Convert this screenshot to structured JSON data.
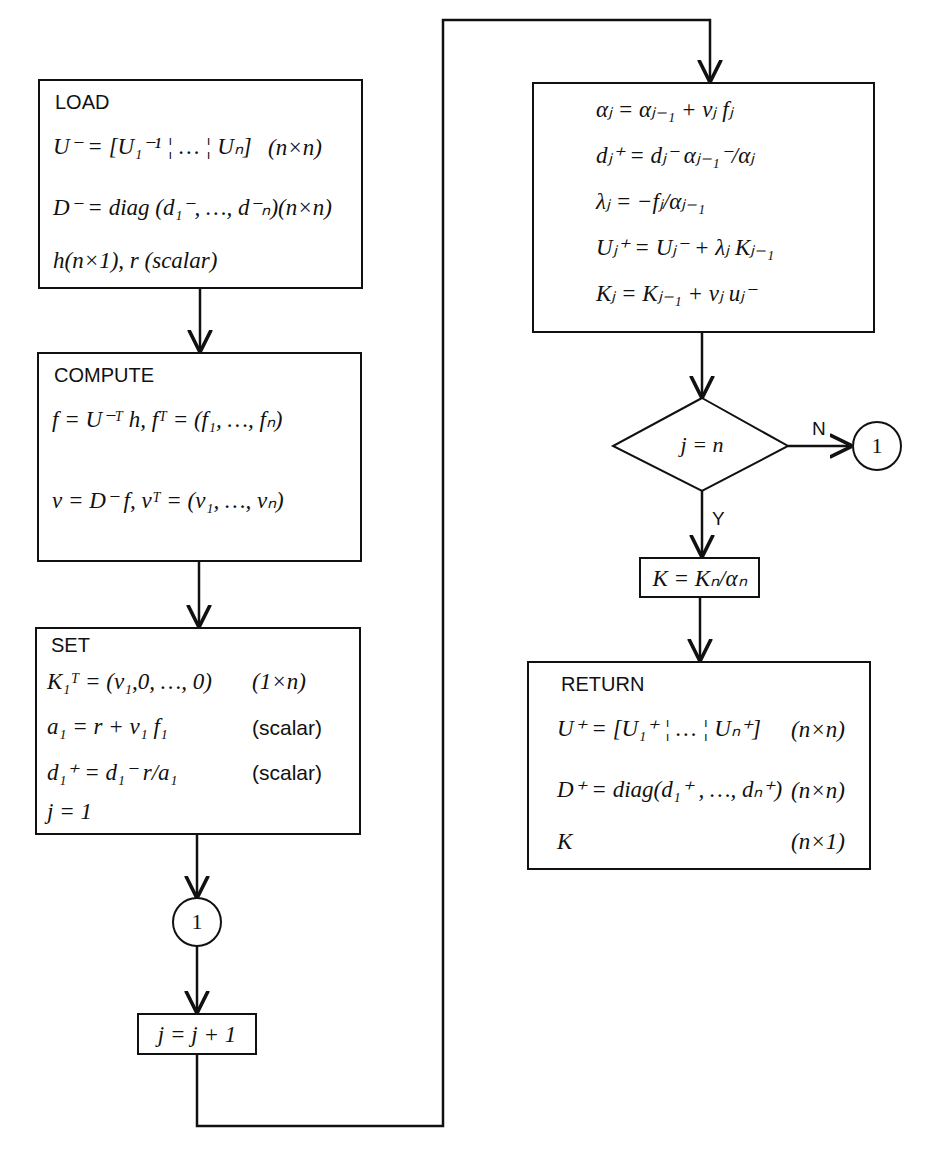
{
  "load": {
    "title": "LOAD",
    "rows": [
      {
        "expr": "U⁻ = [U₁⁻¹ ¦ … ¦ Uₙ]",
        "dim": "(n×n)"
      },
      {
        "expr": "D⁻ = diag (d₁⁻, …, d⁻ₙ)(n×n)",
        "dim": ""
      },
      {
        "expr": "h(n×1), r (scalar)",
        "dim": ""
      }
    ]
  },
  "compute": {
    "title": "COMPUTE",
    "rows": [
      {
        "expr": "f = U⁻ᵀ h, fᵀ = (f₁, …, fₙ)"
      },
      {
        "expr": "v = D⁻ f, vᵀ = (v₁, …, vₙ)"
      }
    ]
  },
  "set": {
    "title": "SET",
    "rows": [
      {
        "expr": "K₁ᵀ = (v₁,0, …, 0)",
        "dim": "(1×n)"
      },
      {
        "expr": "a₁ = r + v₁ f₁",
        "dim": "(scalar)"
      },
      {
        "expr": "d₁⁺ = d₁⁻ r/a₁",
        "dim": "(scalar)"
      },
      {
        "expr": "j = 1",
        "dim": ""
      }
    ]
  },
  "connector_label": "1",
  "increment": {
    "expr": "j = j + 1"
  },
  "loop_body": {
    "rows": [
      {
        "expr": "αⱼ = αⱼ₋₁ + vⱼ fⱼ"
      },
      {
        "expr": "dⱼ⁺ = dⱼ⁻ αⱼ₋₁⁻/αⱼ"
      },
      {
        "expr": "λⱼ = −fⱼ/αⱼ₋₁"
      },
      {
        "expr": "Uⱼ⁺ = Uⱼ⁻ + λⱼ Kⱼ₋₁"
      },
      {
        "expr": "Kⱼ = Kⱼ₋₁ + vⱼ uⱼ⁻"
      }
    ]
  },
  "decision": {
    "expr": "j = n",
    "no_label": "N",
    "yes_label": "Y",
    "no_target": "1"
  },
  "gain": {
    "expr": "K = Kₙ/αₙ"
  },
  "return": {
    "title": "RETURN",
    "rows": [
      {
        "expr": "U⁺ = [U₁⁺ ¦ … ¦ Uₙ⁺]",
        "dim": "(n×n)"
      },
      {
        "expr": "D⁺ = diag(d₁⁺ , …, dₙ⁺)",
        "dim": "(n×n)"
      },
      {
        "expr": "K",
        "dim": "(n×1)"
      }
    ]
  }
}
